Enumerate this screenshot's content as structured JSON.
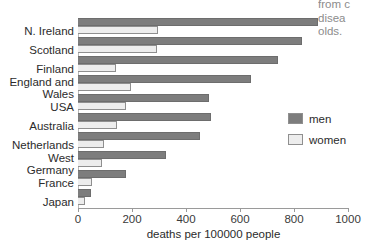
{
  "annotation": {
    "lines": [
      "from c",
      "disea",
      "olds."
    ]
  },
  "chart_data": {
    "type": "bar",
    "orientation": "horizontal",
    "title": "",
    "xlabel": "deaths per 100000 people",
    "ylabel": "",
    "xlim": [
      0,
      1000
    ],
    "grid": false,
    "legend_position": "right",
    "tick_labels": [
      "0",
      "200",
      "400",
      "600",
      "800",
      "1000"
    ],
    "ticks": [
      0,
      200,
      400,
      600,
      800,
      1000
    ],
    "categories": [
      "N. Ireland",
      "Scotland",
      "Finland",
      "England and\nWales",
      "USA",
      "Australia",
      "Netherlands",
      "West\nGermany",
      "France",
      "Japan"
    ],
    "series": [
      {
        "name": "men",
        "color": "#7d7d7d",
        "values": [
          890,
          830,
          740,
          640,
          485,
          492,
          452,
          326,
          178,
          48
        ]
      },
      {
        "name": "women",
        "color": "#ededed",
        "values": [
          296,
          293,
          141,
          196,
          178,
          144,
          96,
          89,
          52,
          26
        ]
      }
    ]
  },
  "legend": {
    "items": [
      {
        "label": "men",
        "color": "#7d7d7d"
      },
      {
        "label": "women",
        "color": "#ededed"
      }
    ]
  }
}
